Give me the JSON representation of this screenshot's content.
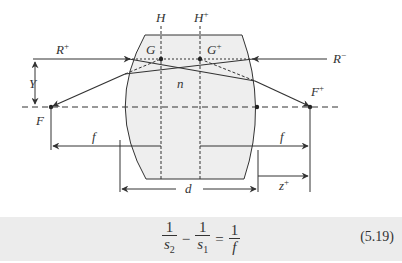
{
  "diagram": {
    "labels": {
      "H": "H",
      "H_plus": "H",
      "G": "G",
      "G_plus": "G",
      "R_plus": "R",
      "R_minus": "R",
      "n": "n",
      "Y": "Y",
      "F": "F",
      "F_plus": "F",
      "f_left": "f",
      "f_right": "f",
      "d": "d",
      "z_plus": "z",
      "sup_plus": "+",
      "sup_minus": "−"
    },
    "colors": {
      "lens_fill": "#eeeeee",
      "line": "#333333",
      "equation_band": "#ececec"
    }
  },
  "equation": {
    "term1": {
      "num": "1",
      "den": "s",
      "sub": "2"
    },
    "minus": "−",
    "term2": {
      "num": "1",
      "den": "s",
      "sub": "1"
    },
    "equals": "=",
    "term3": {
      "num": "1",
      "den": "f"
    },
    "number": "(5.19)"
  }
}
